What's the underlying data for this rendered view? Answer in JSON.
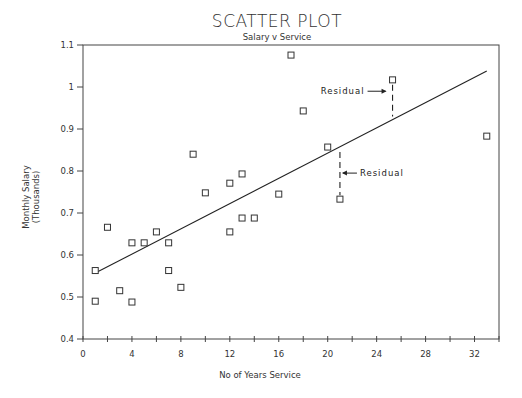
{
  "chart_data": {
    "type": "scatter",
    "title": "SCATTER PLOT",
    "subtitle": "Salary v Service",
    "xlabel": "No of Years Service",
    "ylabel": [
      "Monthly Salary",
      "(Thousands)"
    ],
    "xlim": [
      0,
      34
    ],
    "ylim": [
      0.4,
      1.1
    ],
    "xticks": [
      0,
      4,
      8,
      12,
      16,
      20,
      24,
      28,
      32
    ],
    "xticks_minor": [
      2,
      6,
      10,
      14,
      18,
      22,
      26,
      30,
      34
    ],
    "yticks": [
      0.4,
      0.5,
      0.6,
      0.7,
      0.8,
      0.9,
      1,
      1.1
    ],
    "ytick_labels": [
      "0.4",
      "0.5",
      "0.6",
      "0.7",
      "0.8",
      "0.9",
      "1",
      "1.1"
    ],
    "grid": false,
    "marker": "open-square",
    "series": [
      {
        "name": "Employees",
        "points": [
          {
            "x": 1,
            "y": 0.563
          },
          {
            "x": 1,
            "y": 0.49
          },
          {
            "x": 2,
            "y": 0.666
          },
          {
            "x": 3,
            "y": 0.515
          },
          {
            "x": 4,
            "y": 0.629
          },
          {
            "x": 4,
            "y": 0.488
          },
          {
            "x": 5,
            "y": 0.629
          },
          {
            "x": 6,
            "y": 0.655
          },
          {
            "x": 7,
            "y": 0.629
          },
          {
            "x": 7,
            "y": 0.563
          },
          {
            "x": 8,
            "y": 0.523
          },
          {
            "x": 9,
            "y": 0.84
          },
          {
            "x": 10,
            "y": 0.748
          },
          {
            "x": 12,
            "y": 0.771
          },
          {
            "x": 12,
            "y": 0.655
          },
          {
            "x": 13,
            "y": 0.793
          },
          {
            "x": 13,
            "y": 0.688
          },
          {
            "x": 14,
            "y": 0.688
          },
          {
            "x": 16,
            "y": 0.745
          },
          {
            "x": 17,
            "y": 1.076
          },
          {
            "x": 18,
            "y": 0.943
          },
          {
            "x": 20,
            "y": 0.857
          },
          {
            "x": 21,
            "y": 0.733
          },
          {
            "x": 25.3,
            "y": 1.017
          },
          {
            "x": 33,
            "y": 0.883
          }
        ]
      }
    ],
    "regression_line": {
      "x0": 1,
      "y0": 0.557,
      "x1": 33,
      "y1": 1.038
    },
    "annotations": [
      {
        "text": "Residual",
        "point": {
          "x": 25.3,
          "y": 1.017
        },
        "line_to_y": 0.92,
        "label_side": "left"
      },
      {
        "text": "Residual",
        "point": {
          "x": 21,
          "y": 0.733
        },
        "line_to_y": 0.857,
        "label_side": "right"
      }
    ]
  }
}
